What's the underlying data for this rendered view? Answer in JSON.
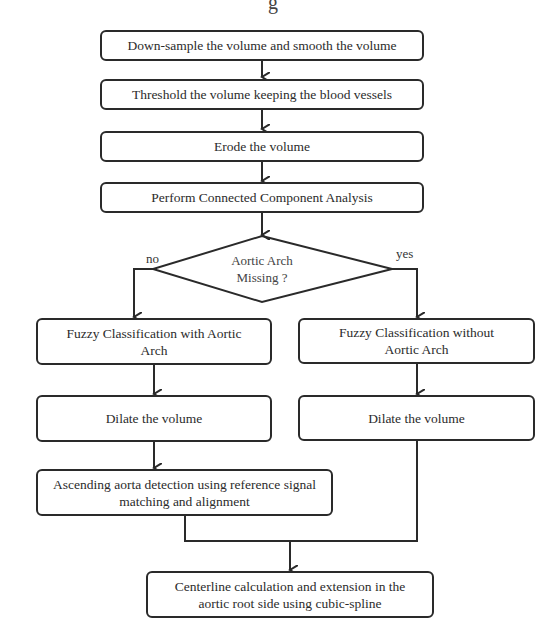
{
  "flowchart": {
    "top_cut_text": "g",
    "steps": [
      {
        "id": "downsample",
        "label": "Down-sample the volume and smooth the volume"
      },
      {
        "id": "threshold",
        "label": "Threshold the volume keeping the blood vessels"
      },
      {
        "id": "erode",
        "label": "Erode the volume"
      },
      {
        "id": "cca",
        "label": "Perform Connected Component Analysis"
      }
    ],
    "decision": {
      "line1": "Aortic Arch",
      "line2": "Missing ?",
      "no_label": "no",
      "yes_label": "yes"
    },
    "left_branch": {
      "fuzzy": "Fuzzy Classification with Aortic Arch",
      "dilate": "Dilate the volume",
      "ascending": "Ascending aorta detection using reference signal matching and alignment"
    },
    "right_branch": {
      "fuzzy": "Fuzzy Classification without Aortic Arch",
      "dilate": "Dilate the volume"
    },
    "final": {
      "label": "Centerline calculation and extension in the aortic root side using cubic-spline"
    },
    "colors": {
      "stroke": "#2a2a2a",
      "background": "#ffffff"
    }
  }
}
